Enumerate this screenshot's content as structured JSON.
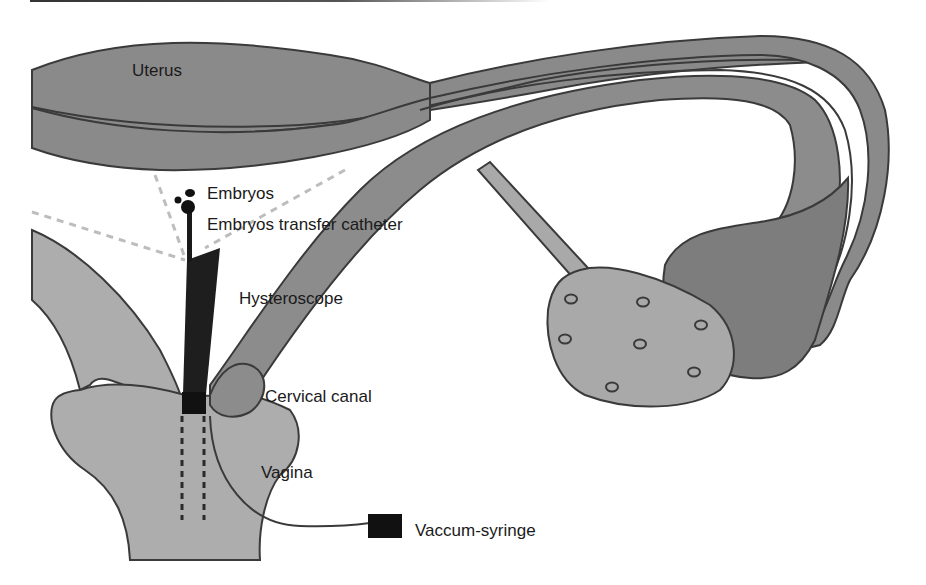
{
  "figure": {
    "type": "anatomical-diagram"
  },
  "labels": {
    "uterus": "Uterus",
    "embryos": "Embryos",
    "catheter": "Embryos transfer catheter",
    "hysteroscope": "Hysteroscope",
    "cervical_canal": "Cervical canal",
    "vagina": "Vagina",
    "syringe": "Vaccum-syringe"
  },
  "colors": {
    "uterus_fill": "#8a8a8a",
    "tube_fill": "#8c8c8c",
    "ovary_fill": "#a9a9a9",
    "fimbria_fill": "#7d7d7d",
    "cervix_fill": "#adadad",
    "outline": "#3a3a3a",
    "instrument": "#1e1e1e",
    "guide_dash": "#bdbdbd",
    "text": "#1a1a1a"
  }
}
